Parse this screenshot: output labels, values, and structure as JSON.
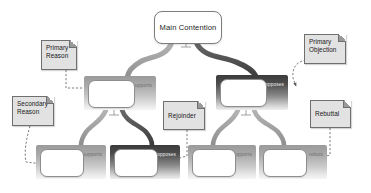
{
  "diagram": {
    "type": "argument-tree",
    "colors": {
      "supports_band": "#a9a9a9",
      "opposes_band": "#4e4e4e",
      "note_fill": "#e2e2e2",
      "node_fill": "#ffffff",
      "background": "#ffffff"
    },
    "root": {
      "label": "Main Contention"
    },
    "level2": [
      {
        "id": "reason-1",
        "relation": "supports",
        "label": ""
      },
      {
        "id": "objection-1",
        "relation": "opposes",
        "label": ""
      }
    ],
    "level3": [
      {
        "id": "sub-1",
        "relation": "supports",
        "label": ""
      },
      {
        "id": "sub-2",
        "relation": "opposes",
        "label": ""
      },
      {
        "id": "sub-3",
        "relation": "supports",
        "label": ""
      },
      {
        "id": "sub-4",
        "relation": "rebuts",
        "label": ""
      }
    ],
    "notes": [
      {
        "id": "note-primary-reason",
        "line1": "Primary",
        "line2": "Reason"
      },
      {
        "id": "note-secondary-reason",
        "line1": "Secondary",
        "line2": "Reason"
      },
      {
        "id": "note-primary-objection",
        "line1": "Primary",
        "line2": "Objection"
      },
      {
        "id": "note-rejoinder",
        "line1": "Rejoinder",
        "line2": ""
      },
      {
        "id": "note-rebuttal",
        "line1": "Rebuttal",
        "line2": ""
      }
    ]
  }
}
